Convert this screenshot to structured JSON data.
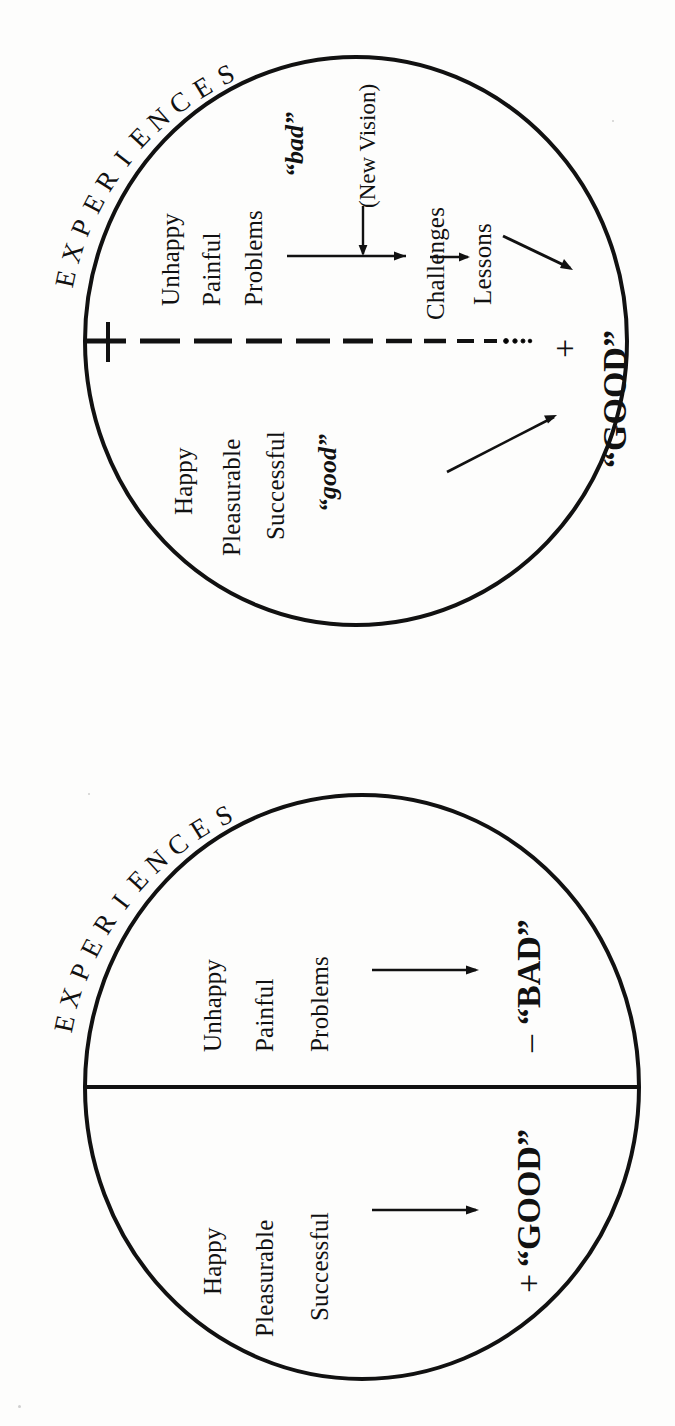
{
  "page": {
    "background_color": "#fdfdfc",
    "ink_color": "#111111"
  },
  "figures": [
    {
      "id": "figure-evolved-perception",
      "position": "top",
      "title_label": "EXPERIENCES",
      "divider_style": "dashed-fading-to-dotted",
      "upper_half": {
        "terms": [
          "Unhappy",
          "Painful",
          "Problems"
        ],
        "quoted_label": "“bad”",
        "transform_note": "(New Vision)",
        "reframed_terms": [
          "Challenges",
          "Lessons"
        ],
        "outcome_sign": "+",
        "outcome_label": "“GOOD”"
      },
      "lower_half": {
        "terms": [
          "Happy",
          "Pleasurable",
          "Successful"
        ],
        "quoted_label": "“good”",
        "outcome_label": "“GOOD”"
      },
      "arrows": [
        {
          "name": "problems-to-challenges",
          "from": "Problems",
          "to": "Challenges"
        },
        {
          "name": "new-vision-down",
          "from": "(New Vision)",
          "to": "problems-to-challenges"
        },
        {
          "name": "challenges-to-lessons",
          "from": "Challenges",
          "to": "Lessons"
        },
        {
          "name": "lessons-to-good",
          "from": "Lessons",
          "to": "“GOOD”"
        },
        {
          "name": "good-to-good",
          "from": "“good”",
          "to": "“GOOD”"
        }
      ]
    },
    {
      "id": "figure-ordinary-perception",
      "position": "bottom",
      "title_label": "EXPERIENCES",
      "divider_style": "solid",
      "upper_half": {
        "terms": [
          "Unhappy",
          "Painful",
          "Problems"
        ],
        "outcome_sign": "−",
        "outcome_label": "“BAD”"
      },
      "lower_half": {
        "terms": [
          "Happy",
          "Pleasurable",
          "Successful"
        ],
        "outcome_sign": "+",
        "outcome_label": "“GOOD”"
      },
      "arrows": [
        {
          "name": "problems-to-bad",
          "from": "Problems",
          "to": "“BAD”"
        },
        {
          "name": "successful-to-good",
          "from": "Successful",
          "to": "“GOOD”"
        }
      ]
    }
  ],
  "top": {
    "experiences": "EXPERIENCES",
    "unhappy": "Unhappy",
    "painful": "Painful",
    "problems": "Problems",
    "bad": "“bad”",
    "new_vision": "(New Vision)",
    "challenges": "Challenges",
    "lessons": "Lessons",
    "plus": "+",
    "good_caps": "“GOOD”",
    "happy": "Happy",
    "pleasurable": "Pleasurable",
    "successful": "Successful",
    "good_lower": "“good”"
  },
  "bottom": {
    "experiences": "EXPERIENCES",
    "unhappy": "Unhappy",
    "painful": "Painful",
    "problems": "Problems",
    "minus": "–",
    "bad_caps": "“BAD”",
    "happy": "Happy",
    "pleasurable": "Pleasurable",
    "successful": "Successful",
    "plus": "+",
    "good_caps": "“GOOD”"
  }
}
